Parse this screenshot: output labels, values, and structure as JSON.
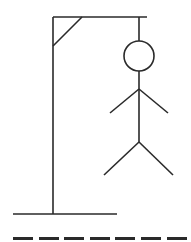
{
  "game": {
    "title": "Hangman",
    "stroke_color": "#2a2a2a",
    "background_color": "#ffffff",
    "wrong_guesses_drawn": [
      "head",
      "body",
      "left-arm",
      "right-arm",
      "left-leg",
      "right-leg"
    ]
  },
  "word": {
    "length": 7,
    "slots": [
      {
        "letter": "",
        "x": 13
      },
      {
        "letter": "",
        "x": 39
      },
      {
        "letter": "",
        "x": 64
      },
      {
        "letter": "",
        "x": 90
      },
      {
        "letter": "",
        "x": 115
      },
      {
        "letter": "",
        "x": 141
      },
      {
        "letter": "",
        "x": 167
      }
    ]
  }
}
